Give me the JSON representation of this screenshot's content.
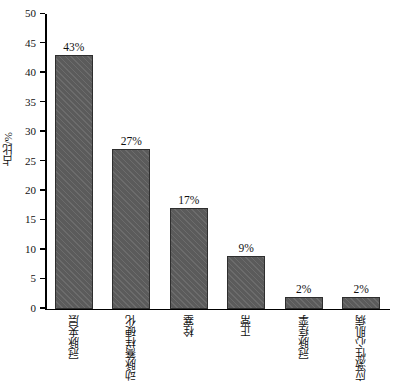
{
  "chart_data": {
    "type": "bar",
    "title": "",
    "xlabel": "",
    "ylabel": "占比/%",
    "ylim": [
      0,
      50
    ],
    "ytick_step": 5,
    "grid": false,
    "legend": "none",
    "categories": [
      "冠脉夹层",
      "动脉簥样硬化",
      "栓塞",
      "正常",
      "冠脉痉挛",
      "应激性心肌病"
    ],
    "values": [
      43,
      27,
      17,
      9,
      2,
      2
    ],
    "data_labels": [
      "43%",
      "27%",
      "17%",
      "9%",
      "2%",
      "2%"
    ],
    "ytick_labels": [
      "0",
      "5",
      "10",
      "15",
      "20",
      "25",
      "30",
      "35",
      "40",
      "45",
      "50"
    ],
    "bar_color": "#5b5b5b",
    "bar_edge_color": "#2e2e2e",
    "axis_color": "#000000",
    "background_color": "#ffffff"
  }
}
